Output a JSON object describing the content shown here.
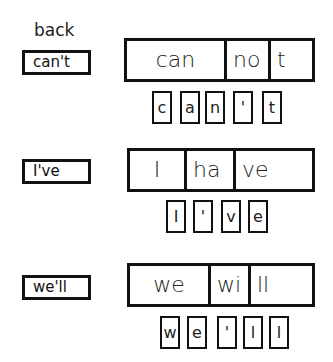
{
  "back_label": "back",
  "rows": [
    {
      "contraction": "can't",
      "segments": [
        "can",
        "no",
        "t"
      ],
      "tiles": [
        "c",
        "a",
        "n",
        "'",
        "t"
      ]
    },
    {
      "contraction": "I've",
      "segments": [
        "I",
        "ha",
        "ve"
      ],
      "tiles": [
        "I",
        "'",
        "v",
        "e"
      ]
    },
    {
      "contraction": "we'll",
      "segments": [
        "we",
        "wi",
        "ll"
      ],
      "tiles": [
        "w",
        "e",
        "'",
        "l",
        "l"
      ]
    }
  ]
}
